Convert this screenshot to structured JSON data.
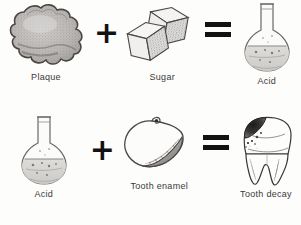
{
  "diagram": {
    "background_color": "#fdfdfc",
    "ink_color": "#121212",
    "caption_color": "#3a3a3a",
    "rows": [
      {
        "id": "equation-plaque-sugar-acid",
        "terms": [
          {
            "label": "Plaque",
            "icon": "plaque-blob-icon"
          },
          {
            "label": "Sugar",
            "icon": "sugar-cubes-icon"
          },
          {
            "label": "Acid",
            "icon": "flask-icon"
          }
        ],
        "operators": [
          {
            "symbol": "+",
            "name": "plus"
          },
          {
            "symbol": "=",
            "name": "equals"
          }
        ]
      },
      {
        "id": "equation-acid-enamel-decay",
        "terms": [
          {
            "label": "Acid",
            "icon": "flask-icon"
          },
          {
            "label": "Tooth  enamel",
            "icon": "tooth-enamel-icon"
          },
          {
            "label": "Tooth decay",
            "icon": "decayed-tooth-icon"
          }
        ],
        "operators": [
          {
            "symbol": "+",
            "name": "plus"
          },
          {
            "symbol": "=",
            "name": "equals"
          }
        ]
      }
    ]
  }
}
